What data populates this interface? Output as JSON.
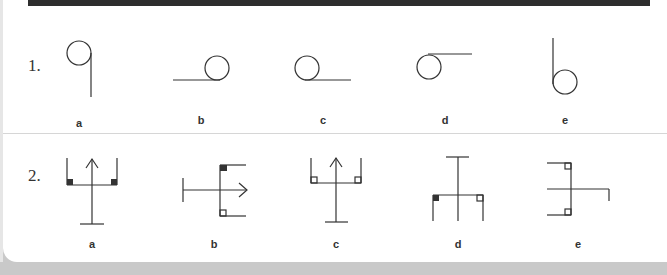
{
  "questions": [
    {
      "number": "1.",
      "options": [
        {
          "label": "a",
          "shape": "circle-with-line-down-right"
        },
        {
          "label": "b",
          "shape": "circle-with-line-left-bottom"
        },
        {
          "label": "c",
          "shape": "circle-with-line-right-bottom"
        },
        {
          "label": "d",
          "shape": "circle-with-line-right-top"
        },
        {
          "label": "e",
          "shape": "circle-with-line-up-left"
        }
      ]
    },
    {
      "number": "2.",
      "options": [
        {
          "label": "a",
          "shape": "trident-up-filled-corners"
        },
        {
          "label": "b",
          "shape": "trident-right-filled-top-open-bottom"
        },
        {
          "label": "c",
          "shape": "trident-up-open-corners"
        },
        {
          "label": "d",
          "shape": "trident-down-filled-left-open-right"
        },
        {
          "label": "e",
          "shape": "trident-left-open-corners-hooked"
        }
      ]
    }
  ],
  "colors": {
    "stroke": "#333333",
    "card": "#ffffff",
    "background": "#c9c9c9",
    "top_bar": "#2e2e2e"
  }
}
